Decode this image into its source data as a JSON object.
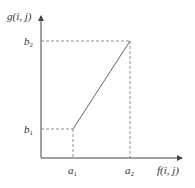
{
  "diagram": {
    "type": "piecewise-linear-gray-transform",
    "y_axis_label": "g(i, j)",
    "x_axis_label": "f(i, j)",
    "y_ticks": [
      {
        "base": "b",
        "sub": "2"
      },
      {
        "base": "b",
        "sub": "1"
      }
    ],
    "x_ticks": [
      {
        "base": "a",
        "sub": "1"
      },
      {
        "base": "a",
        "sub": "2"
      }
    ],
    "segment": {
      "from": [
        "a1",
        "b1"
      ],
      "to": [
        "a2",
        "b2"
      ]
    },
    "colors": {
      "axis": "#444444",
      "line": "#666666",
      "dashed": "#777777",
      "text": "#333333"
    }
  }
}
